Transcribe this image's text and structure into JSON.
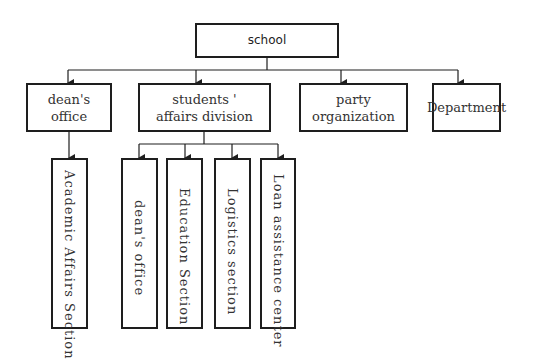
{
  "diagram": {
    "type": "org-chart",
    "root": {
      "label": "school"
    },
    "level2": [
      {
        "id": "deans-office",
        "label": "dean's\noffice"
      },
      {
        "id": "students-affairs",
        "label": "students '\naffairs division"
      },
      {
        "id": "party-organization",
        "label": "party\norganization"
      },
      {
        "id": "department",
        "label": "Department"
      }
    ],
    "level3": [
      {
        "parent": "deans-office",
        "label": "Academic Affairs Section"
      },
      {
        "parent": "students-affairs",
        "label": "dean's office"
      },
      {
        "parent": "students-affairs",
        "label": "Education Section"
      },
      {
        "parent": "students-affairs",
        "label": "Logistics section"
      },
      {
        "parent": "students-affairs",
        "label": "Loan assistance center"
      }
    ],
    "colors": {
      "line": "#1e1e1e",
      "text": "#333333",
      "background": "#ffffff"
    }
  }
}
